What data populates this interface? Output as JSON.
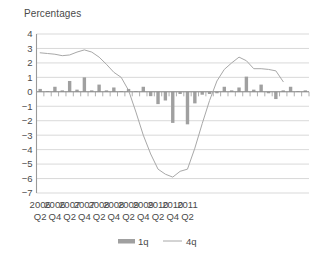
{
  "chart_data": {
    "type": "bar",
    "title": "Percentages",
    "xlabel": "",
    "ylabel": "",
    "ylim": [
      -7,
      4
    ],
    "ytick_step": 1,
    "grid": true,
    "legend_position": "bottom",
    "yticks": [
      "4",
      "3",
      "2",
      "1",
      "0",
      "-1",
      "-2",
      "-3",
      "-4",
      "-5",
      "-6",
      "-7"
    ],
    "categories": [
      "2006 Q2",
      "2006 Q3",
      "2006 Q4",
      "2007 Q1",
      "2007 Q2",
      "2007 Q3",
      "2007 Q4",
      "2008 Q1",
      "2008 Q2",
      "2008 Q3",
      "2008 Q4",
      "2009 Q1",
      "2009 Q2",
      "2009 Q3",
      "2009 Q4",
      "2010 Q1",
      "2010 Q2",
      "2010 Q3",
      "2010 Q4",
      "2011 Q1",
      "2011 Q2",
      "2011 Q3"
    ],
    "xtick_labels": [
      {
        "year": "2006",
        "quarter": "Q2",
        "index": 0
      },
      {
        "year": "2006",
        "quarter": "Q4",
        "index": 2
      },
      {
        "year": "2007",
        "quarter": "Q2",
        "index": 4
      },
      {
        "year": "2007",
        "quarter": "Q4",
        "index": 6
      },
      {
        "year": "2008",
        "quarter": "Q2",
        "index": 8
      },
      {
        "year": "2008",
        "quarter": "Q4",
        "index": 10
      },
      {
        "year": "2009",
        "quarter": "Q2",
        "index": 12
      },
      {
        "year": "2009",
        "quarter": "Q4",
        "index": 14
      },
      {
        "year": "2010",
        "quarter": "Q2",
        "index": 16
      },
      {
        "year": "2010",
        "quarter": "Q4",
        "index": 18
      },
      {
        "year": "2011",
        "quarter": "Q2",
        "index": 20
      }
    ],
    "series": [
      {
        "name": "1q",
        "type": "bar",
        "color": "#a0a0a0",
        "values": [
          0.2,
          0.05,
          0.35,
          0.1,
          0.75,
          0.15,
          1.0,
          0.1,
          0.5,
          0.1,
          0.3,
          0.05,
          0.2,
          0.05,
          0.35,
          -0.3,
          -0.85,
          -0.6,
          -2.15,
          -0.15,
          -2.25,
          -0.8
        ]
      },
      {
        "name": "4q",
        "type": "line",
        "color": "#a8a8a8",
        "values": [
          2.7,
          2.65,
          2.6,
          2.5,
          2.55,
          2.75,
          2.9,
          2.75,
          2.4,
          1.9,
          1.35,
          1.0,
          0.1,
          -1.4,
          -3.0,
          -4.3,
          -5.35,
          -5.7,
          -5.9,
          -5.5,
          -5.35,
          -3.9
        ]
      }
    ],
    "bars_full": [
      0.2,
      0.05,
      0.35,
      0.1,
      0.75,
      0.15,
      1.0,
      0.1,
      0.5,
      0.1,
      0.3,
      0.05,
      0.2,
      0.05,
      0.35,
      -0.3,
      -0.85,
      -0.6,
      -2.15,
      -0.15,
      -2.25,
      -0.8,
      -0.2,
      -0.15,
      -0.1,
      0.35,
      0.1,
      0.3,
      1.05,
      0.15,
      0.5,
      -0.1,
      -0.5,
      0.1,
      0.35,
      0.05,
      0.1
    ],
    "line_full": [
      2.7,
      2.65,
      2.6,
      2.5,
      2.55,
      2.75,
      2.9,
      2.75,
      2.4,
      1.9,
      1.35,
      1.0,
      0.1,
      -1.4,
      -3.0,
      -4.3,
      -5.35,
      -5.7,
      -5.9,
      -5.5,
      -5.35,
      -3.9,
      -2.2,
      -0.6,
      0.75,
      1.55,
      2.0,
      2.4,
      2.15,
      1.6,
      1.6,
      1.55,
      1.45,
      0.7
    ],
    "legend": [
      {
        "label": "1q",
        "marker": "bar",
        "color": "#a0a0a0"
      },
      {
        "label": "4q",
        "marker": "line",
        "color": "#a8a8a8"
      }
    ]
  }
}
